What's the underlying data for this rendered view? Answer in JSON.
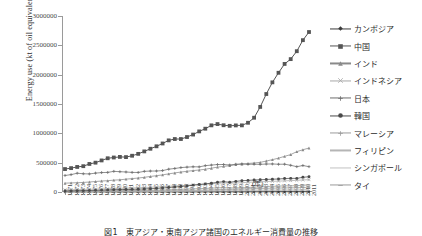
{
  "figure": {
    "caption": "図1　東アジア・東南アジア諸国のエネルギー消費量の推移",
    "xunit": "(年)"
  },
  "axes": {
    "ylabel": "Energy use (kt of oil equivalent)",
    "yticks": [
      "0",
      "500000",
      "1000000",
      "1500000",
      "2000000",
      "2500000",
      "3000000"
    ],
    "ymin": 0,
    "ymax": 3000000,
    "xticks": [
      "1971",
      "1972",
      "1973",
      "1974",
      "1975",
      "1976",
      "1977",
      "1978",
      "1979",
      "1980",
      "1981",
      "1982",
      "1983",
      "1984",
      "1985",
      "1986",
      "1987",
      "1988",
      "1989",
      "1990",
      "1991",
      "1992",
      "1993",
      "1994",
      "1995",
      "1996",
      "1997",
      "1998",
      "1999",
      "2000",
      "2001",
      "2002",
      "2003",
      "2004",
      "2005",
      "2006",
      "2007",
      "2008",
      "2009",
      "2010",
      "2011"
    ]
  },
  "legend": [
    {
      "label": "カンボジア",
      "color": "#3b3b3b",
      "marker": "diamond"
    },
    {
      "label": "中国",
      "color": "#555555",
      "marker": "square"
    },
    {
      "label": "インド",
      "color": "#8a8a8a",
      "marker": "triangle"
    },
    {
      "label": "インドネシア",
      "color": "#a8a8a8",
      "marker": "cross"
    },
    {
      "label": "日本",
      "color": "#6e6e6e",
      "marker": "star"
    },
    {
      "label": "韓国",
      "color": "#4a4a4a",
      "marker": "circle"
    },
    {
      "label": "マレーシア",
      "color": "#9c9c9c",
      "marker": "plus"
    },
    {
      "label": "フィリピン",
      "color": "#b5b5b5",
      "marker": "none"
    },
    {
      "label": "シンガポール",
      "color": "#c2c2c2",
      "marker": "none"
    },
    {
      "label": "タイ",
      "color": "#9a9a9a",
      "marker": "dash"
    }
  ],
  "chart_data": {
    "type": "line",
    "title": "",
    "xlabel": "(年)",
    "ylabel": "Energy use (kt of oil equivalent)",
    "ylim": [
      0,
      3000000
    ],
    "grid": false,
    "legend_position": "right",
    "x": [
      1971,
      1972,
      1973,
      1974,
      1975,
      1976,
      1977,
      1978,
      1979,
      1980,
      1981,
      1982,
      1983,
      1984,
      1985,
      1986,
      1987,
      1988,
      1989,
      1990,
      1991,
      1992,
      1993,
      1994,
      1995,
      1996,
      1997,
      1998,
      1999,
      2000,
      2001,
      2002,
      2003,
      2004,
      2005,
      2006,
      2007,
      2008,
      2009,
      2010,
      2011
    ],
    "series": [
      {
        "name": "中国",
        "values": [
          391000,
          407000,
          427000,
          440000,
          478000,
          500000,
          538000,
          575000,
          588000,
          598000,
          595000,
          618000,
          650000,
          692000,
          737000,
          779000,
          827000,
          880000,
          903000,
          903000,
          937000,
          979000,
          1033000,
          1079000,
          1136000,
          1158000,
          1138000,
          1128000,
          1135000,
          1136000,
          1180000,
          1266000,
          1450000,
          1670000,
          1869000,
          2032000,
          2183000,
          2265000,
          2400000,
          2588000,
          2727000
        ]
      },
      {
        "name": "日本",
        "values": [
          282000,
          296000,
          320000,
          311000,
          308000,
          322000,
          331000,
          334000,
          352000,
          346000,
          341000,
          334000,
          333000,
          352000,
          357000,
          358000,
          365000,
          389000,
          401000,
          416000,
          424000,
          430000,
          428000,
          449000,
          459000,
          468000,
          469000,
          460000,
          473000,
          478000,
          472000,
          474000,
          471000,
          477000,
          478000,
          473000,
          474000,
          455000,
          432000,
          451000,
          432000
        ]
      },
      {
        "name": "インド",
        "values": [
          150000,
          155000,
          158000,
          163000,
          170000,
          179000,
          187000,
          193000,
          202000,
          208000,
          219000,
          228000,
          238000,
          250000,
          265000,
          278000,
          292000,
          309000,
          325000,
          340000,
          353000,
          365000,
          375000,
          388000,
          406000,
          424000,
          436000,
          449000,
          466000,
          476000,
          486000,
          494000,
          505000,
          528000,
          551000,
          577000,
          608000,
          638000,
          688000,
          720000,
          750000
        ]
      },
      {
        "name": "韓国",
        "values": [
          17000,
          19000,
          22000,
          23000,
          25000,
          29000,
          32000,
          36000,
          40000,
          41000,
          43000,
          45000,
          48000,
          52000,
          56000,
          62000,
          69000,
          77000,
          85000,
          93000,
          104000,
          117000,
          127000,
          138000,
          150000,
          165000,
          177000,
          165000,
          181000,
          193000,
          198000,
          205000,
          209000,
          214000,
          218000,
          222000,
          229000,
          233000,
          232000,
          251000,
          260000
        ]
      },
      {
        "name": "インドネシア",
        "values": [
          37000,
          39000,
          41000,
          44000,
          46000,
          49000,
          52000,
          56000,
          60000,
          63000,
          66000,
          68000,
          73000,
          77000,
          81000,
          87000,
          92000,
          97000,
          103000,
          109000,
          115000,
          122000,
          128000,
          134000,
          141000,
          148000,
          155000,
          150000,
          153000,
          159000,
          165000,
          169000,
          173000,
          178000,
          182000,
          185000,
          190000,
          194000,
          199000,
          205000,
          210000
        ]
      },
      {
        "name": "タイ",
        "values": [
          13000,
          14000,
          15000,
          16000,
          16000,
          18000,
          19000,
          21000,
          22000,
          22000,
          23000,
          24000,
          26000,
          28000,
          29000,
          31000,
          34000,
          38000,
          42000,
          45000,
          49000,
          53000,
          57000,
          61000,
          67000,
          72000,
          75000,
          70000,
          71000,
          73000,
          77000,
          82000,
          87000,
          93000,
          97000,
          99000,
          104000,
          105000,
          107000,
          117000,
          120000
        ]
      },
      {
        "name": "マレーシア",
        "values": [
          5000,
          5500,
          6000,
          6500,
          7000,
          7500,
          8000,
          9000,
          10000,
          11000,
          11500,
          12000,
          13000,
          14000,
          15000,
          16000,
          17000,
          19000,
          21000,
          23000,
          25000,
          27000,
          29000,
          32000,
          36000,
          40000,
          44000,
          44000,
          47000,
          51000,
          54000,
          57000,
          60000,
          63000,
          66000,
          68000,
          70000,
          72000,
          73000,
          77000,
          79000
        ]
      },
      {
        "name": "フィリピン",
        "values": [
          12000,
          13000,
          13500,
          13000,
          13500,
          14000,
          15000,
          16000,
          17000,
          17000,
          17000,
          17000,
          17000,
          17500,
          17500,
          18000,
          19000,
          20000,
          21000,
          22000,
          22000,
          23000,
          24000,
          25000,
          27000,
          28000,
          30000,
          30000,
          31000,
          32000,
          32000,
          32000,
          33000,
          33000,
          34000,
          34000,
          35000,
          36000,
          36000,
          38000,
          39000
        ]
      },
      {
        "name": "シンガポール",
        "values": [
          3000,
          3500,
          4000,
          4000,
          4200,
          4500,
          4800,
          5200,
          5600,
          6000,
          6200,
          6400,
          6600,
          7000,
          7500,
          8000,
          8500,
          9200,
          10000,
          11000,
          12000,
          13000,
          14000,
          15000,
          16000,
          17000,
          18000,
          18000,
          19000,
          20000,
          21000,
          22000,
          23000,
          24000,
          25000,
          26000,
          27000,
          28000,
          28000,
          30000,
          31000
        ]
      },
      {
        "name": "カンボジア",
        "values": [
          800,
          800,
          800,
          800,
          800,
          800,
          800,
          800,
          900,
          900,
          900,
          900,
          900,
          1000,
          1000,
          1000,
          1100,
          1100,
          1200,
          1200,
          1300,
          1300,
          1400,
          1500,
          1600,
          1700,
          1800,
          1900,
          2000,
          2100,
          2300,
          2400,
          2600,
          2800,
          3000,
          3200,
          3400,
          3600,
          3800,
          4200,
          4500
        ]
      }
    ]
  }
}
